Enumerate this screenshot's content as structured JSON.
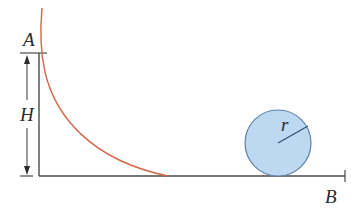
{
  "labels": {
    "point_a": "A",
    "height": "H",
    "radius": "r",
    "point_b": "B"
  },
  "colors": {
    "background": "#ffffff",
    "track_line": "#4a4a4a",
    "curve": "#d2694a",
    "ball_fill": "#bcd9f1",
    "ball_stroke": "#5f82a8",
    "radius_line": "#2f4f72",
    "text": "#2b2b2b"
  },
  "elements": {
    "curved_track": "Curved ramp from A descending to horizontal floor",
    "floor": "Horizontal track to B",
    "ball": "Sphere of radius r resting on floor",
    "height_marker": "Double-headed arrow indicating height H"
  }
}
